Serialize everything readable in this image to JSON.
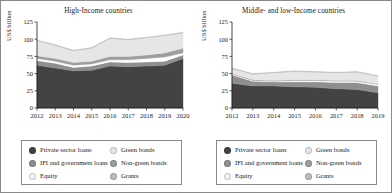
{
  "figure": {
    "y_axis_label": "US$ billion",
    "ylim": [
      0,
      125
    ],
    "yticks": [
      0,
      25,
      50,
      75,
      100,
      125
    ]
  },
  "series_colors": {
    "private_sector_loans": "#434343",
    "ifi_and_government_loans": "#8f8f8f",
    "equity": "#ffffff",
    "green_bonds": "#e6e6e6",
    "non_green_bonds": "#9e9e9e",
    "grants": "#bdbdbd"
  },
  "legend": {
    "items": [
      {
        "label": "Private sector loans",
        "color_key": "private_sector_loans",
        "swatch": "#434343"
      },
      {
        "label": "Green bonds",
        "color_key": "green_bonds",
        "swatch": "#e6e6e6"
      },
      {
        "label": "IFI and government loans",
        "color_key": "ifi_and_government_loans",
        "swatch": "#8f8f8f"
      },
      {
        "label": "Non-green bonds",
        "color_key": "non_green_bonds",
        "swatch": "#9e9e9e"
      },
      {
        "label": "Equity",
        "color_key": "equity",
        "swatch": "#f2f2f2"
      },
      {
        "label": "Grants",
        "color_key": "grants",
        "swatch": "#bdbdbd"
      }
    ]
  },
  "chart_data": [
    {
      "type": "area",
      "id": "high-income",
      "title": "High-Income countries",
      "xlabel": "",
      "ylabel": "US$ billion",
      "ylim": [
        0,
        125
      ],
      "yticks": [
        0,
        25,
        50,
        75,
        100,
        125
      ],
      "grid": false,
      "stacked": true,
      "legend_position": "below",
      "categories": [
        "2012",
        "2013",
        "2014",
        "2015",
        "2016",
        "2017",
        "2018",
        "2019",
        "2020"
      ],
      "series": [
        {
          "name": "Private sector loans",
          "color_key": "private_sector_loans",
          "values": [
            62,
            58,
            54,
            55,
            61,
            60,
            61,
            62,
            72
          ]
        },
        {
          "name": "IFI and government loans",
          "color_key": "ifi_and_government_loans",
          "values": [
            7,
            7,
            5,
            6,
            6,
            6,
            6,
            6,
            5
          ]
        },
        {
          "name": "Equity",
          "color_key": "equity",
          "values": [
            3,
            3,
            3,
            3,
            3,
            4,
            5,
            6,
            3
          ]
        },
        {
          "name": "Non-green bonds",
          "color_key": "non_green_bonds",
          "values": [
            4,
            4,
            4,
            4,
            5,
            5,
            5,
            6,
            7
          ]
        },
        {
          "name": "Green bonds",
          "color_key": "green_bonds",
          "values": [
            22,
            19,
            17,
            19,
            26,
            24,
            25,
            25,
            22
          ]
        },
        {
          "name": "Grants",
          "color_key": "grants",
          "values": [
            1,
            1,
            1,
            1,
            1,
            1,
            1,
            1,
            1
          ]
        }
      ]
    },
    {
      "type": "area",
      "id": "middle-and-low-income",
      "title": "Middle- and low-Income countries",
      "xlabel": "",
      "ylabel": "US$ billion",
      "ylim": [
        0,
        125
      ],
      "yticks": [
        0,
        25,
        50,
        75,
        100,
        125
      ],
      "grid": false,
      "stacked": true,
      "legend_position": "below",
      "categories": [
        "2012",
        "2013",
        "2014",
        "2015",
        "2016",
        "2017",
        "2018",
        "2019"
      ],
      "series": [
        {
          "name": "Private sector loans",
          "color_key": "private_sector_loans",
          "values": [
            36,
            32,
            32,
            31,
            30,
            28,
            27,
            22
          ]
        },
        {
          "name": "IFI and government loans",
          "color_key": "ifi_and_government_loans",
          "values": [
            12,
            7,
            6,
            7,
            8,
            9,
            10,
            10
          ]
        },
        {
          "name": "Equity",
          "color_key": "equity",
          "values": [
            1,
            1,
            1,
            2,
            2,
            2,
            2,
            2
          ]
        },
        {
          "name": "Non-green bonds",
          "color_key": "non_green_bonds",
          "values": [
            1,
            1,
            1,
            1,
            1,
            1,
            1,
            1
          ]
        },
        {
          "name": "Green bonds",
          "color_key": "green_bonds",
          "values": [
            7,
            8,
            11,
            12,
            11,
            11,
            12,
            11
          ]
        },
        {
          "name": "Grants",
          "color_key": "grants",
          "values": [
            1,
            1,
            1,
            1,
            1,
            1,
            1,
            1
          ]
        }
      ]
    }
  ],
  "panels": [
    {
      "title": "High-Income countries",
      "chart_index": 0
    },
    {
      "title": "Middle- and low-Income countries",
      "chart_index": 1
    }
  ]
}
